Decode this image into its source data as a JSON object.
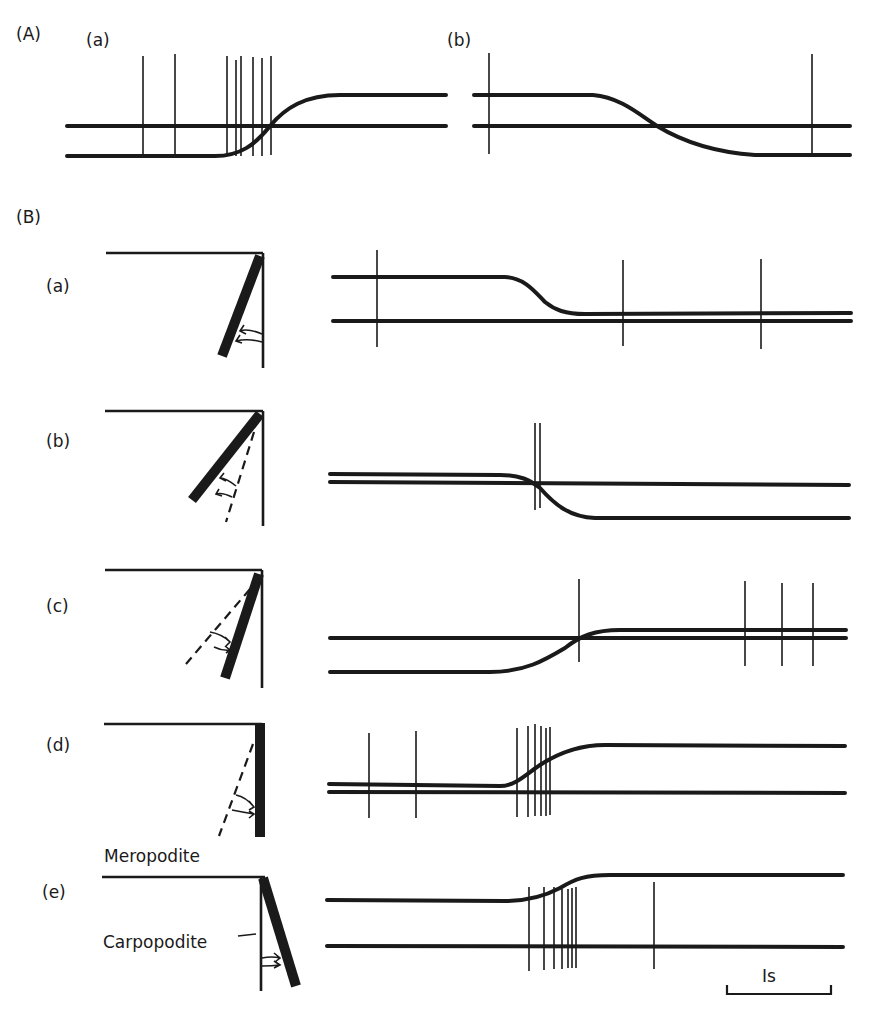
{
  "figure": {
    "panel_A": {
      "label": "(A)",
      "sub_a": {
        "label": "(a)"
      },
      "sub_b": {
        "label": "(b)"
      }
    },
    "panel_B": {
      "label": "(B)",
      "rows": [
        {
          "label": "(a)"
        },
        {
          "label": "(b)"
        },
        {
          "label": "(c)"
        },
        {
          "label": "(d)"
        },
        {
          "label": "(e)"
        }
      ],
      "annotations": {
        "meropodite": "Meropodite",
        "carpopodite": "Carpopodite"
      }
    },
    "scale_bar": {
      "label": "Is",
      "represents": "1 s"
    }
  },
  "diagram_data": {
    "type": "neurophysiology-recording-figure",
    "description": "Position traces (thick lines) with superimposed unit spikes (thin vertical lines) and limb joint schematics (meropodite horizontal, carpopodite thick bar, dashed = previous position, arrows = direction of movement).",
    "panel_A": [
      {
        "sub": "a",
        "trace_change": "rise",
        "spike_count": 8
      },
      {
        "sub": "b",
        "trace_change": "fall",
        "spike_count": 2
      }
    ],
    "panel_B": [
      {
        "row": "a",
        "limb": "carpopodite flexed, moving toward vertical",
        "trace_change": "fall",
        "spike_count": 3
      },
      {
        "row": "b",
        "limb": "carpopodite moves outward from dashed position",
        "trace_change": "fall",
        "spike_count": 2
      },
      {
        "row": "c",
        "limb": "carpopodite moves inward from dashed position",
        "trace_change": "rise",
        "spike_count": 4
      },
      {
        "row": "d",
        "limb": "carpopodite moves to vertical from dashed position",
        "trace_change": "rise",
        "spike_count": 8
      },
      {
        "row": "e",
        "limb": "carpopodite extended past vertical",
        "trace_change": "rise",
        "spike_count": 8
      }
    ],
    "scale_bar_seconds": 1
  }
}
